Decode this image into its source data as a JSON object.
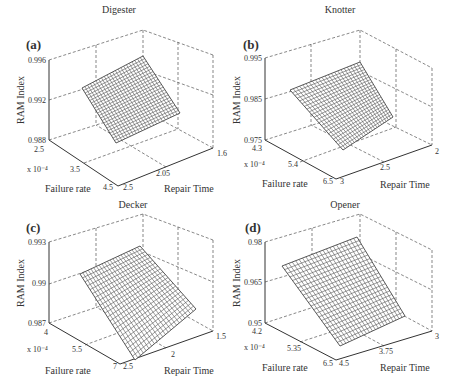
{
  "figure": {
    "panels": [
      {
        "id": "a",
        "label": "(a)",
        "title": "Digester",
        "zlabel": "RAM Index",
        "z_ticks": [
          "0.996",
          "0.992",
          "0.988"
        ],
        "failure_ticks": [
          "2.5",
          "3.5",
          "4.5"
        ],
        "failure_label": "Failure rate",
        "failure_exponent": "x 10⁻⁴",
        "repair_ticks": [
          "2.5",
          "2.05",
          "1.6"
        ],
        "repair_label": "Repair Time"
      },
      {
        "id": "b",
        "label": "(b)",
        "title": "Knotter",
        "zlabel": "RAM Index",
        "z_ticks": [
          "0.995",
          "0.985",
          "0.975"
        ],
        "failure_ticks": [
          "4.3",
          "5.4",
          "6.5"
        ],
        "failure_label": "Failure rate",
        "failure_exponent": "x 10⁻⁴",
        "repair_ticks": [
          "3",
          "2.5",
          "2"
        ],
        "repair_label": "Repair Time"
      },
      {
        "id": "c",
        "label": "(c)",
        "title": "Decker",
        "zlabel": "RAM Index",
        "z_ticks": [
          "0.993",
          "0.99",
          "0.987"
        ],
        "failure_ticks": [
          "4",
          "5.5",
          "7"
        ],
        "failure_label": "Failure rate",
        "failure_exponent": "x 10⁻⁴",
        "repair_ticks": [
          "2.5",
          "2",
          "1.5"
        ],
        "repair_label": "Repair Time"
      },
      {
        "id": "d",
        "label": "(d)",
        "title": "Opener",
        "zlabel": "RAM Index",
        "z_ticks": [
          "0.98",
          "0.965",
          "0.95"
        ],
        "failure_ticks": [
          "4.2",
          "5.35",
          "6.5"
        ],
        "failure_label": "Failure rate",
        "failure_exponent": "x 10⁻⁴",
        "repair_ticks": [
          "4.5",
          "3.75",
          "3"
        ],
        "repair_label": "Repair Time"
      }
    ]
  },
  "chart_data": [
    {
      "type": "surface",
      "title": "Digester",
      "panel": "(a)",
      "xlabel": "Failure rate (x 10^-4)",
      "ylabel": "Repair Time",
      "zlabel": "RAM Index",
      "x_range": [
        2.5,
        4.5
      ],
      "y_range": [
        1.6,
        2.5
      ],
      "z_range": [
        0.988,
        0.996
      ],
      "x_ticks": [
        2.5,
        3.5,
        4.5
      ],
      "y_ticks": [
        2.5,
        2.05,
        1.6
      ],
      "z_ticks": [
        0.988,
        0.992,
        0.996
      ],
      "corner_values": {
        "x2.5_y1.6": 0.9955,
        "x2.5_y2.5": 0.9935,
        "x4.5_y1.6": 0.9915,
        "x4.5_y2.5": 0.989
      },
      "grid": true,
      "mesh": "20x20"
    },
    {
      "type": "surface",
      "title": "Knotter",
      "panel": "(b)",
      "xlabel": "Failure rate (x 10^-4)",
      "ylabel": "Repair Time",
      "zlabel": "RAM Index",
      "x_range": [
        4.3,
        6.5
      ],
      "y_range": [
        2,
        3
      ],
      "z_range": [
        0.975,
        0.995
      ],
      "x_ticks": [
        4.3,
        5.4,
        6.5
      ],
      "y_ticks": [
        3,
        2.5,
        2
      ],
      "z_ticks": [
        0.975,
        0.985,
        0.995
      ],
      "corner_values": {
        "x4.3_y2": 0.988,
        "x4.3_y3": 0.985,
        "x6.5_y2": 0.982,
        "x6.5_y3": 0.978
      },
      "grid": true,
      "mesh": "20x20"
    },
    {
      "type": "surface",
      "title": "Decker",
      "panel": "(c)",
      "xlabel": "Failure rate (x 10^-4)",
      "ylabel": "Repair Time",
      "zlabel": "RAM Index",
      "x_range": [
        4,
        7
      ],
      "y_range": [
        1.5,
        2.5
      ],
      "z_range": [
        0.987,
        0.993
      ],
      "x_ticks": [
        4,
        5.5,
        7
      ],
      "y_ticks": [
        2.5,
        2,
        1.5
      ],
      "z_ticks": [
        0.987,
        0.99,
        0.993
      ],
      "corner_values": {
        "x4_y1.5": 0.9925,
        "x4_y2.5": 0.9912,
        "x7_y1.5": 0.9885,
        "x7_y2.5": 0.9868
      },
      "grid": true,
      "mesh": "20x20"
    },
    {
      "type": "surface",
      "title": "Opener",
      "panel": "(d)",
      "xlabel": "Failure rate (x 10^-4)",
      "ylabel": "Repair Time",
      "zlabel": "RAM Index",
      "x_range": [
        4.2,
        6.5
      ],
      "y_range": [
        3,
        4.5
      ],
      "z_range": [
        0.95,
        0.98
      ],
      "x_ticks": [
        4.2,
        5.35,
        6.5
      ],
      "y_ticks": [
        4.5,
        3.75,
        3
      ],
      "z_ticks": [
        0.95,
        0.965,
        0.98
      ],
      "corner_values": {
        "x4.2_y3": 0.978,
        "x4.2_y4.5": 0.973,
        "x6.5_y3": 0.962,
        "x6.5_y4.5": 0.952
      },
      "grid": true,
      "mesh": "20x20"
    }
  ]
}
